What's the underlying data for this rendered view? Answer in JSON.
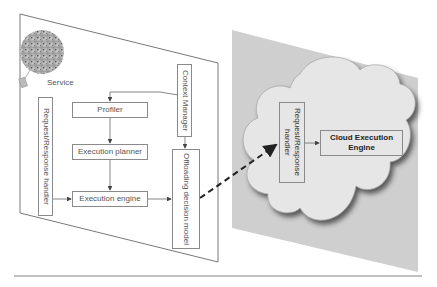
{
  "diagram": {
    "device_side": {
      "service_label": "Service",
      "request_response_handler": "Request/Response handler",
      "profiler": "Profiler",
      "execution_planner": "Execution planner",
      "execution_engine": "Execution engine",
      "context_manager": "Context Manager",
      "offloading_decision_model": "Offloading decision model"
    },
    "cloud_side": {
      "request_response_handler": "Request/Response handler",
      "cloud_execution_engine": "Cloud Execution Engine"
    },
    "connections": [
      {
        "from": "Context Manager",
        "to": "Profiler"
      },
      {
        "from": "Context Manager",
        "to": "Offloading decision model"
      },
      {
        "from": "Profiler",
        "to": "Execution planner"
      },
      {
        "from": "Execution planner",
        "to": "Execution engine"
      },
      {
        "from": "Request/Response handler",
        "to": "Execution engine"
      },
      {
        "from": "Execution engine",
        "to": "Offloading decision model"
      },
      {
        "from": "Offloading decision model",
        "to": "Cloud Request/Response handler",
        "style": "dashed"
      },
      {
        "from": "Cloud Request/Response handler",
        "to": "Cloud Execution Engine"
      }
    ],
    "colors": {
      "device_panel": "#ffffff",
      "cloud_panel": "#cfcfcf",
      "cloud_fill": "#e6e6e6",
      "box_border": "#8a8a8a",
      "dashed_arrow": "#222222"
    }
  }
}
